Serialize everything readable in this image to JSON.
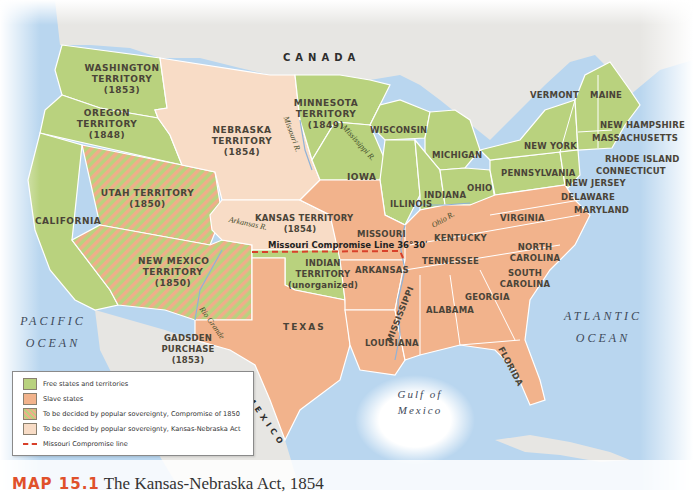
{
  "map": {
    "title_number": "MAP 15.1",
    "title": "The Kansas-Nebraska Act, 1854",
    "colors": {
      "free": "#b9d27e",
      "slave": "#f2b38c",
      "popular_1850_stripe_a": "#b9d27e",
      "popular_1850_stripe_b": "#efae8a",
      "kansas_nebraska": "#f8dcc6",
      "foreign_land": "#e7e6e3",
      "water": "#b9d6ef",
      "missouri_line": "#d8402a"
    },
    "countries": {
      "canada": "CANADA",
      "mexico": "MEXICO"
    },
    "water_bodies": {
      "pacific": [
        "PACIFIC",
        "OCEAN"
      ],
      "atlantic": [
        "ATLANTIC",
        "OCEAN"
      ],
      "gulf": [
        "Gulf of",
        "Mexico"
      ]
    },
    "rivers": {
      "missouri": "Missouri R.",
      "mississippi": "Mississippi R.",
      "arkansas": "Arkansas R.",
      "ohio": "Ohio R.",
      "rio_grande": "Rio Grande"
    },
    "territories": {
      "washington": [
        "WASHINGTON",
        "TERRITORY",
        "(1853)"
      ],
      "oregon": [
        "OREGON",
        "TERRITORY",
        "(1848)"
      ],
      "minnesota": [
        "MINNESOTA",
        "TERRITORY",
        "(1849)"
      ],
      "nebraska": [
        "NEBRASKA",
        "TERRITORY",
        "(1854)"
      ],
      "utah": [
        "UTAH TERRITORY",
        "(1850)"
      ],
      "kansas": [
        "KANSAS TERRITORY",
        "(1854)"
      ],
      "new_mexico": [
        "NEW MEXICO",
        "TERRITORY",
        "(1850)"
      ],
      "indian": [
        "INDIAN",
        "TERRITORY",
        "(unorganized)"
      ],
      "gadsden": [
        "GADSDEN",
        "PURCHASE",
        "(1853)"
      ]
    },
    "states": {
      "california": "CALIFORNIA",
      "iowa": "IOWA",
      "wisconsin": "WISCONSIN",
      "michigan": "MICHIGAN",
      "illinois": "ILLINOIS",
      "indiana": "INDIANA",
      "ohio": "OHIO",
      "pennsylvania": "PENNSYLVANIA",
      "new_york": "NEW YORK",
      "vermont": "VERMONT",
      "maine": "MAINE",
      "new_hampshire": "NEW HAMPSHIRE",
      "massachusetts": "MASSACHUSETTS",
      "rhode_island": "RHODE ISLAND",
      "connecticut": "CONNECTICUT",
      "new_jersey": "NEW JERSEY",
      "delaware": "DELAWARE",
      "maryland": "MARYLAND",
      "virginia": "VIRGINIA",
      "missouri": "MISSOURI",
      "kentucky": "KENTUCKY",
      "tennessee": "TENNESSEE",
      "north_carolina": [
        "NORTH",
        "CAROLINA"
      ],
      "south_carolina": [
        "SOUTH",
        "CAROLINA"
      ],
      "arkansas": "ARKANSAS",
      "mississippi": "MISSISSIPPI",
      "alabama": "ALABAMA",
      "georgia": "GEORGIA",
      "louisiana": "LOUISIANA",
      "florida": "FLORIDA",
      "texas": "TEXAS"
    },
    "missouri_compromise_label": "Missouri Compromise Line 36°30ʹ"
  },
  "legend": {
    "items": [
      {
        "label": "Free states and territories",
        "type": "free"
      },
      {
        "label": "Slave states",
        "type": "slave"
      },
      {
        "label": "To be decided by popular sovereignty, Compromise of 1850",
        "type": "popular_1850"
      },
      {
        "label": "To be decided by popular sovereignty, Kansas-Nebraska Act",
        "type": "kansas_nebraska"
      },
      {
        "label": "Missouri Compromise line",
        "type": "line"
      }
    ]
  }
}
